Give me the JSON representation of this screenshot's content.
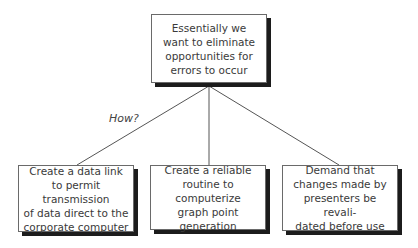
{
  "diagram": {
    "root": {
      "text": "Essentially we\nwant to eliminate\nopportunities for\nerrors to occur"
    },
    "edge_label": "How?",
    "children": [
      {
        "text": "Create a data link\nto permit transmission\nof data direct to the\ncorporate computer"
      },
      {
        "text": "Create a reliable\nroutine to computerize\ngraph point\ngeneration"
      },
      {
        "text": "Demand that\nchanges made by\npresenters be revali-\ndated before use"
      }
    ]
  }
}
